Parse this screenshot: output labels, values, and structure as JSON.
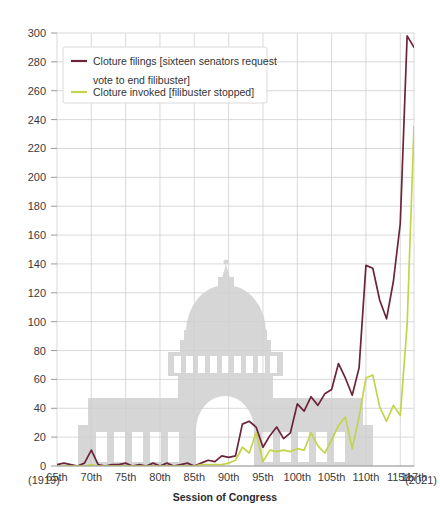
{
  "chart_data": {
    "type": "line",
    "title": "",
    "xlabel": "Session of Congress",
    "ylabel": "",
    "ylim": [
      0,
      300
    ],
    "ytick_step": 20,
    "yticks": [
      0,
      20,
      40,
      60,
      80,
      100,
      120,
      140,
      160,
      180,
      200,
      220,
      240,
      260,
      280,
      300
    ],
    "xlim": [
      65,
      117
    ],
    "xticks": [
      65,
      70,
      75,
      80,
      85,
      90,
      95,
      100,
      105,
      110,
      115,
      117
    ],
    "xtick_labels": [
      "65th",
      "70th",
      "75th",
      "80th",
      "85th",
      "90th",
      "95th",
      "100th",
      "105th",
      "110th",
      "115th",
      "117th"
    ],
    "x_start_year_label": "(1919)",
    "x_end_year_label": "(2021)",
    "grid": true,
    "legend_position": "top-left",
    "x": [
      65,
      66,
      67,
      68,
      69,
      70,
      71,
      72,
      73,
      74,
      75,
      76,
      77,
      78,
      79,
      80,
      81,
      82,
      83,
      84,
      85,
      86,
      87,
      88,
      89,
      90,
      91,
      92,
      93,
      94,
      95,
      96,
      97,
      98,
      99,
      100,
      101,
      102,
      103,
      104,
      105,
      106,
      107,
      108,
      109,
      110,
      111,
      112,
      113,
      114,
      115,
      116,
      117
    ],
    "series": [
      {
        "name": "Cloture filings [sixteen senators request vote to end filibuster]",
        "short_name": "cloture-filings",
        "color": "#6B2438",
        "values": [
          1,
          2,
          1,
          0,
          2,
          11,
          1,
          0,
          1,
          1,
          2,
          0,
          1,
          0,
          2,
          0,
          2,
          0,
          1,
          2,
          0,
          2,
          4,
          3,
          7,
          6,
          7,
          29,
          31,
          27,
          13,
          21,
          27,
          19,
          23,
          43,
          38,
          48,
          42,
          50,
          53,
          71,
          61,
          49,
          68,
          139,
          137,
          115,
          102,
          128,
          168,
          298,
          290
        ],
        "ylim_note": "values are count of cloture motions filed"
      },
      {
        "name": "Cloture invoked [filibuster stopped]",
        "short_name": "cloture-invoked",
        "color": "#C3D44A",
        "values": [
          0,
          0,
          0,
          0,
          0,
          1,
          0,
          0,
          0,
          0,
          0,
          0,
          0,
          0,
          0,
          0,
          0,
          0,
          0,
          0,
          0,
          1,
          1,
          1,
          1,
          2,
          4,
          13,
          9,
          23,
          3,
          11,
          10,
          11,
          10,
          12,
          11,
          23,
          14,
          9,
          18,
          28,
          34,
          12,
          34,
          61,
          63,
          41,
          31,
          42,
          35,
          98,
          235
        ]
      }
    ],
    "annotations": [],
    "watermark": "capitol-building-silhouette"
  },
  "legend": {
    "entries": [
      {
        "label_line1": "Cloture filings [sixteen senators request",
        "label_line2": "vote to end filibuster]",
        "color": "#6B2438"
      },
      {
        "label_line1": "Cloture invoked [filibuster stopped]",
        "label_line2": "",
        "color": "#C3D44A"
      }
    ]
  },
  "colors": {
    "grid": "#cfcfcf",
    "axis": "#9a9a9a",
    "text": "#3a3a3a",
    "watermark": "#d6d6d6",
    "background": "#ffffff"
  }
}
